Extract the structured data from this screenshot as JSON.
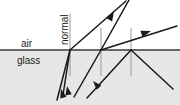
{
  "diagram": {
    "media": {
      "upper": {
        "label": "air",
        "fill": "#ffffff"
      },
      "lower": {
        "label": "glass",
        "fill": "#e7e7e7"
      }
    },
    "interface": {
      "name": "air-glass boundary",
      "y": 50,
      "x_start": 0,
      "x_end": 180,
      "color": "#3a3a3a",
      "width": 1.6
    },
    "normal_label": "normal",
    "normals": [
      {
        "x": 70,
        "y_top": 14,
        "y_bottom": 76,
        "color": "#9a9a9a"
      },
      {
        "x": 101,
        "y_top": 28,
        "y_bottom": 76,
        "color": "#9a9a9a"
      },
      {
        "x": 131,
        "y_top": 28,
        "y_bottom": 76,
        "color": "#9a9a9a"
      }
    ],
    "rays": [
      {
        "name": "incident-ray-1",
        "x1": 57,
        "y1": 99,
        "x2": 70,
        "y2": 50,
        "arrow": "none",
        "color": "#1a1a1a"
      },
      {
        "name": "ray-1-upward-arrow",
        "x1": 70,
        "y1": 50,
        "x2": 58,
        "y2": 96,
        "arrow": "end",
        "color": "#1a1a1a"
      },
      {
        "name": "reflected-ray-1",
        "x1": 70,
        "y1": 50,
        "x2": 63,
        "y2": 93,
        "arrow": "end",
        "color": "#1a1a1a"
      },
      {
        "name": "refracted-ray-1-transmitted",
        "x1": 70,
        "y1": 50,
        "x2": 125,
        "y2": 2,
        "arrow": "mid",
        "color": "#1a1a1a"
      },
      {
        "name": "incident-ray-2",
        "x1": 101,
        "y1": 50,
        "x2": 75,
        "y2": 95,
        "arrow": "end",
        "color": "#1a1a1a"
      },
      {
        "name": "reflected-ray-2-steep",
        "x1": 101,
        "y1": 50,
        "x2": 128,
        "y2": 0,
        "arrow": "none",
        "color": "#1a1a1a"
      },
      {
        "name": "incident-ray-3",
        "x1": 131,
        "y1": 50,
        "x2": 88,
        "y2": 97,
        "arrow": "mid",
        "color": "#1a1a1a"
      },
      {
        "name": "refracted-ray-3-shallow",
        "x1": 101,
        "y1": 50,
        "x2": 176,
        "y2": 26,
        "arrow": "mid",
        "color": "#1a1a1a"
      },
      {
        "name": "transmitted-ray-3-down",
        "x1": 131,
        "y1": 50,
        "x2": 172,
        "y2": 88,
        "arrow": "none",
        "color": "#1a1a1a"
      }
    ],
    "arrowheads": [
      {
        "name": "arrowhead-up-left-1",
        "x": 59,
        "y": 92,
        "angle": 255
      },
      {
        "name": "arrowhead-up-left-2",
        "x": 66,
        "y": 88,
        "angle": 258
      },
      {
        "name": "arrowhead-up-left-3",
        "x": 90,
        "y": 84,
        "angle": 228
      },
      {
        "name": "arrowhead-up-right-steep",
        "x": 112,
        "y": 13,
        "angle": 299
      },
      {
        "name": "arrowhead-up-right-shallow",
        "x": 149,
        "y": 32,
        "angle": 342
      }
    ]
  }
}
